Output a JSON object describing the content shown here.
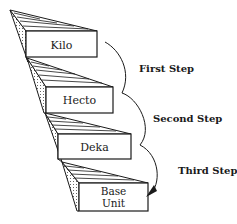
{
  "diagram": {
    "type": "metric-staircase",
    "colors": {
      "stroke": "#1a1a1a",
      "background": "#ffffff"
    },
    "steps": [
      {
        "label": "Kilo"
      },
      {
        "label": "Hecto"
      },
      {
        "label": "Deka"
      },
      {
        "label_line1": "Base",
        "label_line2": "Unit"
      }
    ],
    "transitions": [
      {
        "label": "First Step"
      },
      {
        "label": "Second Step"
      },
      {
        "label": "Third Step"
      }
    ]
  }
}
